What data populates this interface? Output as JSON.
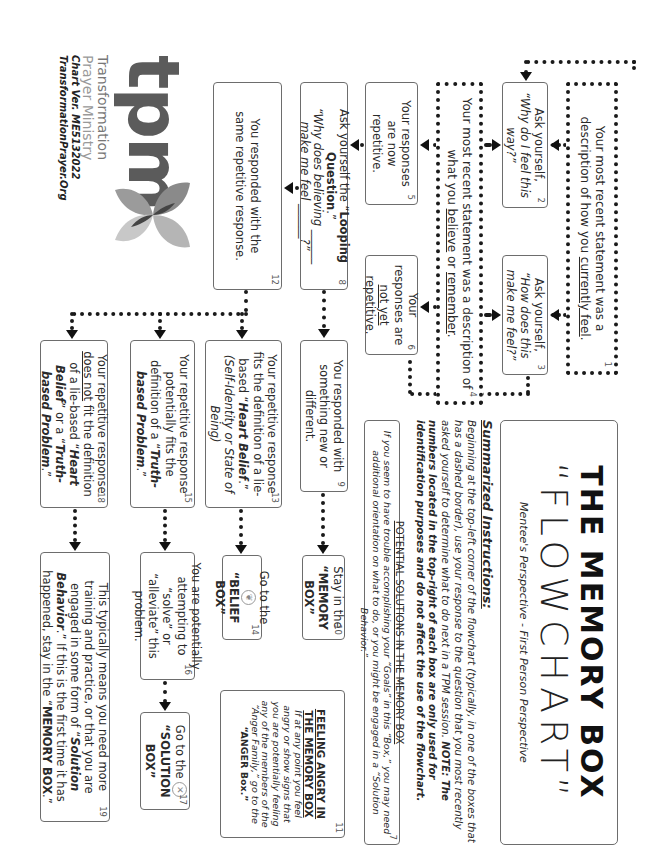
{
  "header": {
    "title": "THE MEMORY BOX",
    "subtitle": "“FLOWCHART”",
    "perspective": "Mentee's Perspective - First Person Perspective"
  },
  "instructions": {
    "heading": "Summarized Instructions:",
    "body_start": "Beginning at the top-left corner of the flowchart (typically, in one of the boxes that has a dashed border), use your response to the question that you most recently asked yourself to determine what to do next in a TPM session.",
    "note": "NOTE: The numbers located in the top-right of each box are only used for identification purposes and do not affect the use of the flowchart."
  },
  "boxes": {
    "b1": {
      "num": "1",
      "pre": "Your most recent statement was a description of how you ",
      "u": "currently feel",
      "post": "."
    },
    "b2": {
      "num": "2",
      "line1": "Ask yourself,",
      "line2": "“Why do I feel this way?”"
    },
    "b3": {
      "num": "3",
      "line1": "Ask yourself,",
      "line2": "“How does this make me feel?”"
    },
    "b4": {
      "num": "4",
      "pre": "Your most recent statement was a description of what you ",
      "u1": "believe",
      "mid": " or ",
      "u2": "remember",
      "post": "."
    },
    "b5": {
      "num": "5",
      "text": "Your responses are now repetitive."
    },
    "b6": {
      "num": "6",
      "pre": "Your responses are ",
      "u": "not yet",
      "post": " repetitive."
    },
    "b7": {
      "num": "7",
      "heading": "POTENTIAL SOLUTIONS IN THE MEMORY BOX",
      "body": "If you seem to have trouble accomplishing your “Goals” in this “Box,” you may need additional orientation on what to do, or you might be engaged in a “Solution Behavior.”"
    },
    "b8": {
      "num": "8",
      "pre": "Ask yourself the “",
      "b": "Looping Question",
      "post": ".”",
      "q1": "“Why does believing ______",
      "q2": "make me feel ______?”"
    },
    "b9": {
      "num": "9",
      "text": "You responded with something new or different."
    },
    "b10": {
      "num": "10",
      "line1": "Stay in the",
      "line2": "“MEMORY BOX”"
    },
    "b11": {
      "num": "11",
      "heading": "FEELING ANGRY IN THE MEMORY BOX",
      "body": "If at any point you feel angry or show signs that you are potentially feeling any of the members of the “Anger Family,” go to the",
      "target": "“ANGER Box.”"
    },
    "b12": {
      "num": "12",
      "text": "You responded with the same repetitive response."
    },
    "b13": {
      "num": "13",
      "pre": "Your repetitive response fits the definition of a lie-based “",
      "bi": "Heart Belief",
      "post": ".”",
      "paren": "(Self-Identity or State of Being)"
    },
    "b14": {
      "num": "14",
      "line1": "Go to the",
      "line2": "“BELIEF BOX”",
      "icon": "belief-icon"
    },
    "b15": {
      "num": "15",
      "pre": "Your repetitive response potentially fits the definition of a “",
      "bi": "Truth-based Problem",
      "post": ".”"
    },
    "b16": {
      "num": "16",
      "text": "You are potentially attempting to “solve” or “alleviate” this problem."
    },
    "b17": {
      "num": "17",
      "line1": "Go to the",
      "line2": "“SOLUTION BOX”",
      "icon": "solution-x-icon"
    },
    "b18": {
      "num": "18",
      "pre": "Your repetitive response ",
      "u": "does not",
      "mid": " fit the definition of a lie-based “",
      "bi1": "Heart Belief",
      "mid2": "” or a “",
      "bi2": "Truth-based Problem",
      "post": ".”"
    },
    "b19": {
      "num": "19",
      "pre": "This typically means you need more training and practice, or that you are engaged in some form of “",
      "bi": "Solution Behavior",
      "mid": ".” If this is the first time it has happened, stay in the “",
      "b": "MEMORY BOX",
      "post": ".”"
    }
  },
  "logo": {
    "mark": "tpm",
    "line1": "Transformation",
    "line2": "Prayer Ministry",
    "version": "Chart Ver. ME5132022",
    "site": "TransformationPrayer.Org"
  },
  "colors": {
    "connector": "#1a1a1a",
    "box_border": "#6d6d6d",
    "logo_gray": "#5b5b5b"
  }
}
